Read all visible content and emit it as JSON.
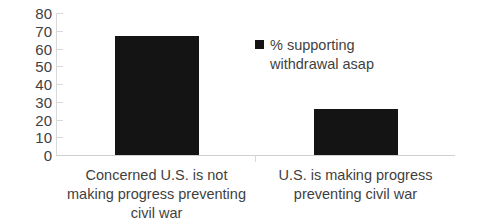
{
  "chart_data": {
    "type": "bar",
    "title": "",
    "subtitle": "",
    "xlabel": "",
    "ylabel": "",
    "categories": [
      "Concerned U.S. is not making progress preventing civil war",
      "U.S. is making progress preventing civil war"
    ],
    "series": [
      {
        "name": "% supporting withdrawal asap",
        "color": "#141414",
        "values": [
          67,
          26
        ]
      }
    ],
    "values": [
      67,
      26
    ],
    "ylim": [
      0,
      80
    ],
    "ytick_step": 10,
    "yticks": [
      80,
      70,
      60,
      50,
      40,
      30,
      20,
      10,
      0
    ],
    "ytick_labels": [
      "80",
      "70",
      "60",
      "50",
      "40",
      "30",
      "20",
      "10",
      "0"
    ],
    "grid": false,
    "legend": {
      "position": "upper-right-inside",
      "entries": [
        {
          "label": "% supporting withdrawal asap",
          "color": "#141414",
          "marker": "square"
        }
      ]
    },
    "axis_color": "#d9d9d9",
    "text_color": "#3f3f3f",
    "background": "#ffffff"
  }
}
